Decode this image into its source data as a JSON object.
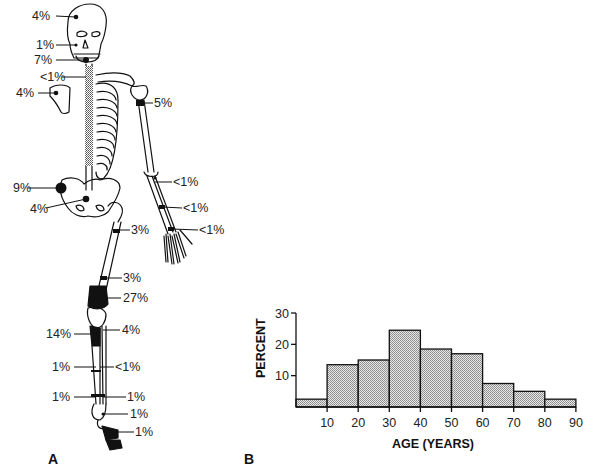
{
  "panels": {
    "a": {
      "letter": "A"
    },
    "b": {
      "letter": "B"
    }
  },
  "skeleton_labels": [
    {
      "site": "skull-vault",
      "text": "4%"
    },
    {
      "site": "mandible",
      "text": "1%"
    },
    {
      "site": "cervical-spine",
      "text": "7%"
    },
    {
      "site": "thoracic-spine",
      "text": "<1%"
    },
    {
      "site": "scapula",
      "text": "4%"
    },
    {
      "site": "proximal-humerus",
      "text": "5%"
    },
    {
      "site": "ilium",
      "text": "9%"
    },
    {
      "site": "sacrum",
      "text": "4%"
    },
    {
      "site": "proximal-radius-ulna",
      "text": "<1%"
    },
    {
      "site": "mid-forearm",
      "text": "<1%"
    },
    {
      "site": "distal-radius",
      "text": "<1%"
    },
    {
      "site": "proximal-femur",
      "text": "3%"
    },
    {
      "site": "mid-femur",
      "text": "3%"
    },
    {
      "site": "distal-femur",
      "text": "27%"
    },
    {
      "site": "proximal-tibia",
      "text": "14%"
    },
    {
      "site": "proximal-fibula",
      "text": "4%"
    },
    {
      "site": "mid-tibia",
      "text": "1%"
    },
    {
      "site": "mid-fibula",
      "text": "<1%"
    },
    {
      "site": "distal-tibia",
      "text": "1%"
    },
    {
      "site": "distal-fibula",
      "text": "1%"
    },
    {
      "site": "talus-calcaneus",
      "text": "1%"
    },
    {
      "site": "foot",
      "text": "1%"
    }
  ],
  "chart_data": {
    "type": "bar",
    "title": "",
    "xlabel": "AGE (YEARS)",
    "ylabel": "PERCENT",
    "categories": [
      "0-10",
      "10-20",
      "20-30",
      "30-40",
      "40-50",
      "50-60",
      "60-70",
      "70-80",
      "80-90"
    ],
    "values": [
      2.5,
      13.5,
      15,
      24.5,
      18.5,
      17,
      7.5,
      5,
      2.5
    ],
    "x_ticks": [
      "10",
      "20",
      "30",
      "40",
      "50",
      "60",
      "70",
      "80",
      "90"
    ],
    "y_ticks": [
      "10",
      "20",
      "30"
    ],
    "ylim": [
      0,
      30
    ],
    "xlim": [
      0,
      90
    ],
    "grid": false,
    "legend": null,
    "bar_fill": "#c8c8c8",
    "bar_pattern": "stippled"
  }
}
